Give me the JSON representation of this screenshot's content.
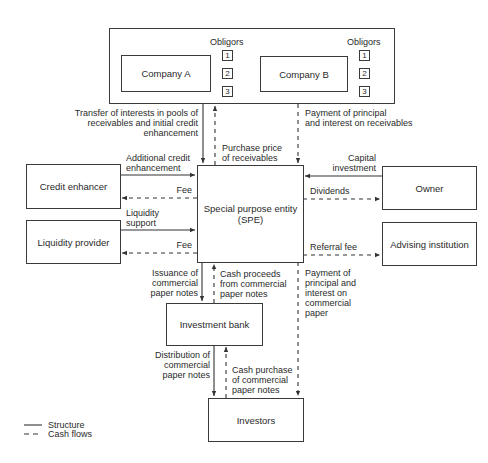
{
  "diagram": {
    "top_group": {
      "company_a": {
        "label": "Company A",
        "obligors_label": "Obligors",
        "obligors": [
          "1",
          "2",
          "3"
        ]
      },
      "company_b": {
        "label": "Company B",
        "obligors_label": "Obligors",
        "obligors": [
          "1",
          "2",
          "3"
        ]
      }
    },
    "nodes": {
      "spe": "Special purpose entity\n(SPE)",
      "credit_enhancer": "Credit enhancer",
      "liquidity_provider": "Liquidity provider",
      "owner": "Owner",
      "advising_institution": "Advising institution",
      "investment_bank": "Investment bank",
      "investors": "Investors"
    },
    "flows": {
      "transfer_of_interests": "Transfer of interests in pools of\nreceivables and initial credit\nenhancement",
      "purchase_price": "Purchase price\nof receivables",
      "payment_receivables": "Payment of principal\nand interest on receivables",
      "additional_credit": "Additional credit\nenhancement",
      "fee_credit": "Fee",
      "liquidity_support": "Liquidity\nsupport",
      "fee_liquidity": "Fee",
      "capital_investment": "Capital\ninvestment",
      "dividends": "Dividends",
      "referral_fee": "Referral fee",
      "issuance_cp": "Issuance of\ncommercial\npaper notes",
      "cash_proceeds": "Cash proceeds\nfrom commercial\npaper notes",
      "payment_cp": "Payment of\nprincipal and\ninterest on\ncommercial\npaper",
      "distribution_cp": "Distribution of\ncommercial\npaper notes",
      "cash_purchase": "Cash purchase\nof commercial\npaper notes"
    },
    "legend": {
      "structure": "Structure",
      "cash_flows": "Cash flows"
    }
  }
}
